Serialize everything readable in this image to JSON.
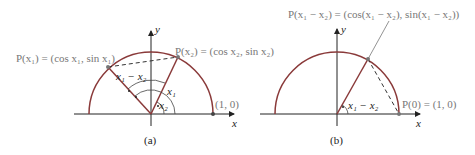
{
  "panel_a": {
    "caption": "(a)",
    "label_p1": "P(x₁) = (cos x₁, sin x₁)",
    "label_p2": "P(x₂) = (cos x₂, sin x₂)",
    "label_10": "(1, 0)",
    "angle_diff": "x₁ − x₂",
    "angle_x1": "x₁",
    "angle_x2": "x₂",
    "axis_x": "x",
    "axis_y": "y"
  },
  "panel_b": {
    "caption": "(b)",
    "label_p": "P(x₁ − x₂) = (cos(x₁ − x₂), sin(x₁ − x₂))",
    "label_p0": "P(0) = (1, 0)",
    "angle_diff": "x₁ − x₂",
    "axis_x": "x",
    "axis_y": "y"
  },
  "colors": {
    "curve": "#8a3a3a",
    "axis": "#222222",
    "radius": "#8a3a3a",
    "label": "#777777"
  }
}
